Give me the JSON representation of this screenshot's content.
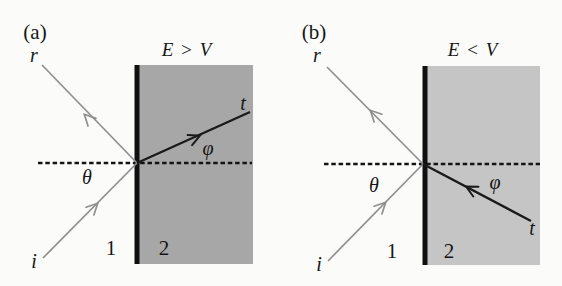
{
  "figure": {
    "colors": {
      "background": "#fbfbfa",
      "medium2_a": "#a7a7a7",
      "medium2_b": "#c5c5c5",
      "barrier": "#101010",
      "normal_dash": "#141414",
      "ray_gray": "#8f8f8f",
      "ray_black": "#1a1a1a",
      "text": "#161616"
    },
    "panels": [
      {
        "panel_label": "(a)",
        "condition_label": "E > V",
        "reflected_label": "r",
        "incident_label": "i",
        "transmitted_label": "t",
        "incidence_angle_label": "θ",
        "refraction_angle_label": "φ",
        "medium1_label": "1",
        "medium2_label": "2"
      },
      {
        "panel_label": "(b)",
        "condition_label": "E < V",
        "reflected_label": "r",
        "incident_label": "i",
        "transmitted_label": "t",
        "incidence_angle_label": "θ",
        "refraction_angle_label": "φ",
        "medium1_label": "1",
        "medium2_label": "2"
      }
    ]
  }
}
